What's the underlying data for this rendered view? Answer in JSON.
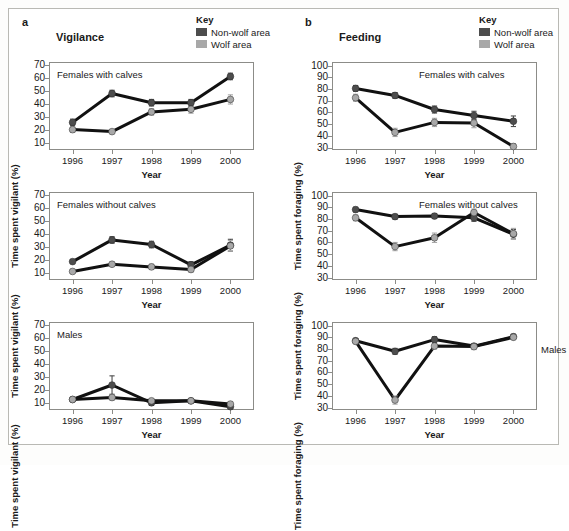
{
  "figure": {
    "background": "#ffffff",
    "frame_color": "#b9b9b4"
  },
  "colors": {
    "non_wolf": "#4d4d4d",
    "wolf": "#a8a8a8",
    "line": "#111111",
    "axis": "#8c8c88",
    "text": "#1a1a1a"
  },
  "panels": [
    {
      "letter": "a",
      "title": "Vigilance",
      "key": {
        "title": "Key",
        "items": [
          {
            "label": "Non-wolf area",
            "color": "#4d4d4d"
          },
          {
            "label": "Wolf area",
            "color": "#a8a8a8"
          }
        ]
      },
      "ylabel": "Time spent vigilant (%)",
      "xlabel": "Year",
      "charts": [
        {
          "group": "Females with calves"
        },
        {
          "group": "Females without calves"
        },
        {
          "group": "Males"
        }
      ]
    },
    {
      "letter": "b",
      "title": "Feeding",
      "key": {
        "title": "Key",
        "items": [
          {
            "label": "Non-wolf area",
            "color": "#4d4d4d"
          },
          {
            "label": "Wolf area",
            "color": "#a8a8a8"
          }
        ]
      },
      "ylabel": "Time spent foraging (%)",
      "xlabel": "Year",
      "charts": [
        {
          "group": "Females with calves"
        },
        {
          "group": "Females without calves"
        },
        {
          "group": "Males"
        }
      ]
    }
  ],
  "chart_data": [
    {
      "id": "a1",
      "type": "line",
      "title": "Females with calves",
      "panel": "a - Vigilance",
      "xlabel": "Year",
      "ylabel": "Time spent vigilant (%)",
      "categories": [
        "1996",
        "1997",
        "1998",
        "1999",
        "2000"
      ],
      "ylim": [
        5,
        72
      ],
      "yticks": [
        10,
        20,
        30,
        40,
        50,
        60,
        70
      ],
      "grid": false,
      "legend": "Key (top right, outside)",
      "series": [
        {
          "name": "Non-wolf area",
          "color": "#4d4d4d",
          "values": [
            26,
            48,
            41,
            41,
            61
          ],
          "errors": [
            2.5,
            2.5,
            2.5,
            2.5,
            2.5
          ]
        },
        {
          "name": "Wolf area",
          "color": "#a8a8a8",
          "values": [
            20.5,
            19,
            34,
            36,
            43.5
          ],
          "errors": [
            2.0,
            1.5,
            2.5,
            3.0,
            3.5
          ]
        }
      ]
    },
    {
      "id": "a2",
      "type": "line",
      "title": "Females without calves",
      "panel": "a - Vigilance",
      "xlabel": "Year",
      "ylabel": "Time spent vigilant (%)",
      "categories": [
        "1996",
        "1997",
        "1998",
        "1999",
        "2000"
      ],
      "ylim": [
        5,
        72
      ],
      "yticks": [
        10,
        20,
        30,
        40,
        50,
        60,
        70
      ],
      "grid": false,
      "series": [
        {
          "name": "Non-wolf area",
          "color": "#4d4d4d",
          "values": [
            19,
            35.5,
            32,
            16.5,
            31.5
          ],
          "errors": [
            1.5,
            2.5,
            2.5,
            2.5,
            4.5
          ]
        },
        {
          "name": "Wolf area",
          "color": "#a8a8a8",
          "values": [
            11.5,
            17,
            15,
            13,
            31
          ],
          "errors": [
            1.5,
            1.5,
            2.0,
            2.0,
            4.0
          ]
        }
      ]
    },
    {
      "id": "a3",
      "type": "line",
      "title": "Males",
      "panel": "a - Vigilance",
      "xlabel": "Year",
      "ylabel": "Time spent vigilant (%)",
      "categories": [
        "1996",
        "1997",
        "1998",
        "1999",
        "2000"
      ],
      "ylim": [
        5,
        72
      ],
      "yticks": [
        10,
        20,
        30,
        40,
        50,
        60,
        70
      ],
      "grid": false,
      "series": [
        {
          "name": "Non-wolf area",
          "color": "#4d4d4d",
          "values": [
            13,
            24,
            10.5,
            12,
            7.5
          ],
          "errors": [
            1.5,
            7.0,
            2.0,
            1.5,
            1.5
          ]
        },
        {
          "name": "Wolf area",
          "color": "#a8a8a8",
          "values": [
            13,
            14.5,
            12,
            12,
            9.5
          ],
          "errors": [
            1.5,
            2.0,
            1.5,
            1.5,
            1.5
          ]
        }
      ]
    },
    {
      "id": "b1",
      "type": "line",
      "title": "Females with calves",
      "panel": "b - Feeding",
      "xlabel": "Year",
      "ylabel": "Time spent foraging (%)",
      "categories": [
        "1996",
        "1997",
        "1998",
        "1999",
        "2000"
      ],
      "ylim": [
        28,
        103
      ],
      "yticks": [
        30,
        40,
        50,
        60,
        70,
        80,
        90,
        100
      ],
      "grid": false,
      "series": [
        {
          "name": "Non-wolf area",
          "color": "#4d4d4d",
          "values": [
            80.5,
            74.5,
            62.5,
            57.5,
            52.5
          ],
          "errors": [
            2.5,
            2.5,
            3.0,
            3.5,
            4.5
          ]
        },
        {
          "name": "Wolf area",
          "color": "#a8a8a8",
          "values": [
            72.5,
            43,
            51.5,
            51,
            31
          ],
          "errors": [
            3.0,
            3.5,
            3.5,
            4.0,
            2.5
          ]
        }
      ]
    },
    {
      "id": "b2",
      "type": "line",
      "title": "Females without calves",
      "panel": "b - Feeding",
      "xlabel": "Year",
      "ylabel": "Time spent foraging (%)",
      "categories": [
        "1996",
        "1997",
        "1998",
        "1999",
        "2000"
      ],
      "ylim": [
        28,
        103
      ],
      "yticks": [
        30,
        40,
        50,
        60,
        70,
        80,
        90,
        100
      ],
      "grid": false,
      "series": [
        {
          "name": "Non-wolf area",
          "color": "#4d4d4d",
          "values": [
            88,
            82,
            82.5,
            81,
            67
          ],
          "errors": [
            2.0,
            2.0,
            2.0,
            3.0,
            4.0
          ]
        },
        {
          "name": "Wolf area",
          "color": "#a8a8a8",
          "values": [
            81,
            56.5,
            64,
            85.5,
            67.5
          ],
          "errors": [
            2.5,
            3.5,
            4.0,
            3.0,
            4.5
          ]
        }
      ]
    },
    {
      "id": "b3",
      "type": "line",
      "title": "Males",
      "panel": "b - Feeding",
      "xlabel": "Year",
      "ylabel": "Time spent foraging (%)",
      "categories": [
        "1996",
        "1997",
        "1998",
        "1999",
        "2000"
      ],
      "ylim": [
        28,
        103
      ],
      "yticks": [
        30,
        40,
        50,
        60,
        70,
        80,
        90,
        100
      ],
      "grid": false,
      "series": [
        {
          "name": "Non-wolf area",
          "color": "#4d4d4d",
          "values": [
            87,
            78,
            88,
            82.5,
            90.5
          ],
          "errors": [
            2.0,
            2.5,
            2.5,
            2.0,
            2.0
          ]
        },
        {
          "name": "Wolf area",
          "color": "#a8a8a8",
          "values": [
            86.5,
            36.5,
            82.5,
            82,
            90
          ],
          "errors": [
            2.0,
            3.5,
            2.5,
            2.5,
            2.0
          ]
        }
      ]
    }
  ]
}
